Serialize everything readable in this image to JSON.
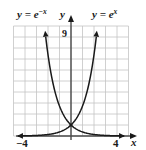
{
  "chart_data": {
    "type": "line",
    "title": "",
    "xlabel": "x",
    "ylabel": "y",
    "xlim": [
      -5,
      5
    ],
    "ylim": [
      0,
      10
    ],
    "grid": true,
    "grid_step": {
      "x": 1,
      "y": 1
    },
    "tick_labels": {
      "x": [
        {
          "value": -4,
          "label": "−4"
        },
        {
          "value": 4,
          "label": "4"
        }
      ],
      "y": [
        {
          "value": 9,
          "label": "9"
        }
      ]
    },
    "series": [
      {
        "name": "y = e^{-x}",
        "label_base": "y = e",
        "label_exp": "−x",
        "function": "exp(-x)",
        "x": [
          -2.3,
          -2,
          -1.5,
          -1,
          -0.5,
          0,
          0.5,
          1,
          1.5,
          2,
          3,
          4
        ],
        "values": [
          9.97,
          7.39,
          4.48,
          2.72,
          1.65,
          1.0,
          0.61,
          0.37,
          0.22,
          0.14,
          0.05,
          0.02
        ]
      },
      {
        "name": "y = e^{x}",
        "label_base": "y = e",
        "label_exp": "x",
        "function": "exp(x)",
        "x": [
          -4,
          -3,
          -2,
          -1.5,
          -1,
          -0.5,
          0,
          0.5,
          1,
          1.5,
          2,
          2.3
        ],
        "values": [
          0.02,
          0.05,
          0.14,
          0.22,
          0.37,
          0.61,
          1.0,
          1.65,
          2.72,
          4.48,
          7.39,
          9.97
        ]
      }
    ],
    "annotations": [
      {
        "text": "intersection",
        "x": 0,
        "y": 1
      }
    ],
    "colors": {
      "curve": "#1a1a1a",
      "axis": "#4a4a4a",
      "grid": "#c4c4c4",
      "background": "#ffffff"
    }
  }
}
